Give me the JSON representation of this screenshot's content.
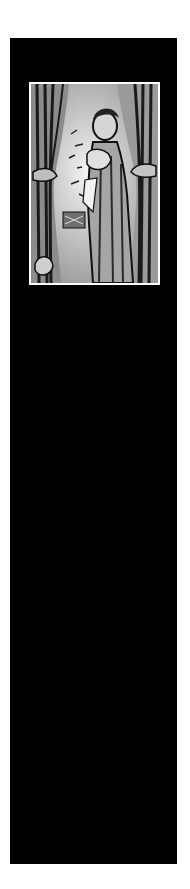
{
  "page": {
    "background": "#ffffff",
    "panel_color": "#000000"
  },
  "illustration": {
    "description": "Woodcut-style grayscale illustration of a woman holding a child, standing between drawn-back curtains",
    "frame_color": "#ffffff"
  }
}
